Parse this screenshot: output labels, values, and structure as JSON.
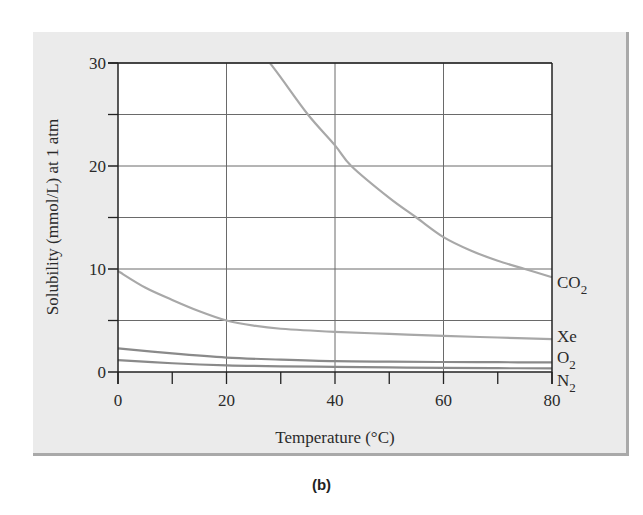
{
  "caption": "(b)",
  "chart_data": {
    "type": "line",
    "title": "",
    "xlabel": "Temperature (°C)",
    "ylabel": "Solubility (mmol/L) at 1 atm",
    "xlim": [
      0,
      80
    ],
    "ylim": [
      0,
      30
    ],
    "xticks": [
      0,
      20,
      40,
      60,
      80
    ],
    "xminor_ticks": [
      10,
      30,
      50,
      70
    ],
    "yticks": [
      0,
      10,
      20,
      30
    ],
    "ygrid": [
      5,
      10,
      15,
      20,
      25,
      30
    ],
    "grid": true,
    "legend_position": "inline-right",
    "series": [
      {
        "name": "CO2",
        "label_main": "CO",
        "label_sub": "2",
        "color": "#a8a8a8",
        "x": [
          28,
          30,
          35,
          40,
          43,
          50,
          55,
          60,
          65,
          70,
          75,
          80
        ],
        "y": [
          30,
          28.6,
          25,
          22,
          20,
          16.9,
          15,
          13.1,
          11.8,
          10.8,
          10,
          9.2
        ]
      },
      {
        "name": "Xe",
        "label_main": "Xe",
        "label_sub": "",
        "color": "#a8a8a8",
        "x": [
          0,
          5,
          10,
          15,
          20,
          25,
          30,
          40,
          50,
          60,
          70,
          80
        ],
        "y": [
          9.8,
          8.2,
          7.0,
          5.9,
          5.0,
          4.5,
          4.2,
          3.9,
          3.7,
          3.5,
          3.35,
          3.2
        ]
      },
      {
        "name": "O2",
        "label_main": "O",
        "label_sub": "2",
        "color": "#8a8a8a",
        "x": [
          0,
          10,
          20,
          30,
          40,
          50,
          60,
          70,
          80
        ],
        "y": [
          2.3,
          1.8,
          1.4,
          1.2,
          1.05,
          1.0,
          0.97,
          0.95,
          0.93
        ]
      },
      {
        "name": "N2",
        "label_main": "N",
        "label_sub": "2",
        "color": "#8a8a8a",
        "x": [
          0,
          10,
          20,
          30,
          40,
          50,
          60,
          70,
          80
        ],
        "y": [
          1.15,
          0.85,
          0.65,
          0.55,
          0.5,
          0.45,
          0.4,
          0.37,
          0.35
        ]
      }
    ]
  }
}
